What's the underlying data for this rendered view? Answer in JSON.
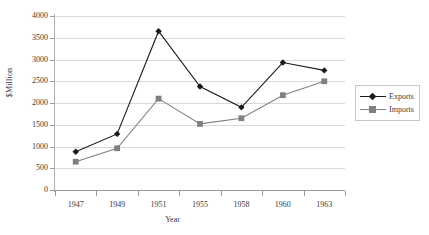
{
  "chart_data": {
    "type": "line",
    "title": "",
    "xlabel": "Year",
    "ylabel": "$Million",
    "categories": [
      "1947",
      "1949",
      "1951",
      "1955",
      "1958",
      "1960",
      "1963"
    ],
    "ylim": [
      0,
      4000
    ],
    "yticks": [
      0,
      500,
      1000,
      1500,
      2000,
      2500,
      3000,
      3500,
      4000
    ],
    "ytick_labels": [
      "0",
      "500",
      "1000",
      "1500",
      "2000",
      "2500",
      "3000",
      "3500",
      "4000"
    ],
    "grid": true,
    "legend_position": "right",
    "series": [
      {
        "name": "Exports",
        "color": "#1a1a1a",
        "marker": "diamond",
        "values": [
          880,
          1290,
          3650,
          2380,
          1900,
          2930,
          2750
        ]
      },
      {
        "name": "Imports",
        "color": "#808080",
        "marker": "square",
        "values": [
          650,
          960,
          2100,
          1520,
          1650,
          2180,
          2500
        ]
      }
    ]
  },
  "legend": {
    "items": [
      {
        "label": "Exports"
      },
      {
        "label": "Imports"
      }
    ]
  },
  "colors": {
    "exports": "#1a1a1a",
    "imports": "#808080",
    "gridline": "#d9d9d9",
    "axis": "#9a9a9a",
    "text": "#3a3a3a"
  }
}
